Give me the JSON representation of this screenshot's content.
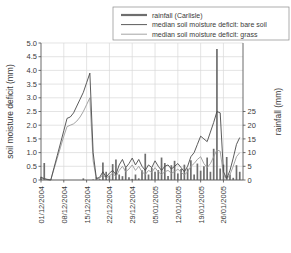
{
  "chart_data": {
    "type": "line",
    "title": "",
    "xlabel": "",
    "ylabel": "soil moisture deficit (mm)",
    "y2label": "rainfall (mm)",
    "ylim": [
      0,
      5.0
    ],
    "y2lim": [
      0,
      50
    ],
    "yticks": [
      "0",
      "0.5",
      "1.0",
      "1.5",
      "2.0",
      "2.5",
      "3.0",
      "3.5",
      "4.0",
      "4.5",
      "5.0"
    ],
    "ytick_values": [
      0,
      0.5,
      1.0,
      1.5,
      2.0,
      2.5,
      3.0,
      3.5,
      4.0,
      4.5,
      5.0
    ],
    "y2ticks": [
      "0",
      "5",
      "10",
      "15",
      "20",
      "25"
    ],
    "y2tick_values": [
      0,
      5,
      10,
      15,
      20,
      25
    ],
    "xticks": [
      "01/12/2004",
      "08/12/2004",
      "15/12/2004",
      "22/12/2004",
      "29/12/2004",
      "05/01/2005",
      "12/01/2005",
      "19/01/2005",
      "26/01/2005"
    ],
    "xtick_days": [
      0,
      7,
      14,
      21,
      28,
      35,
      42,
      49,
      56
    ],
    "xlim_days": [
      0,
      62
    ],
    "grid": true,
    "legend_position": "top-right",
    "legend": [
      {
        "label": "rainfall (Carlisle)",
        "color": "#6e6e6e",
        "style": "bar",
        "width": 2.2
      },
      {
        "label": "median soil moisture deficit: bare soil",
        "color": "#4a4a4a",
        "style": "line",
        "width": 0.9
      },
      {
        "label": "median soil moisture deficit: grass",
        "color": "#9a9a9a",
        "style": "line",
        "width": 0.9
      }
    ],
    "series": [
      {
        "name": "rainfall (Carlisle)",
        "axis": "right",
        "type": "bar",
        "unit": "mm",
        "x": [
          0,
          1,
          2,
          3,
          4,
          5,
          6,
          7,
          8,
          9,
          10,
          11,
          12,
          13,
          14,
          15,
          16,
          17,
          18,
          19,
          20,
          21,
          22,
          23,
          24,
          25,
          26,
          27,
          28,
          29,
          30,
          31,
          32,
          33,
          34,
          35,
          36,
          37,
          38,
          39,
          40,
          41,
          42,
          43,
          44,
          45,
          46,
          47,
          48,
          49,
          50,
          51,
          52,
          53,
          54,
          55,
          56,
          57,
          58,
          59,
          60,
          61
        ],
        "values": [
          1.2,
          6.2,
          0.4,
          0.2,
          0,
          0,
          0,
          0,
          0,
          0,
          0,
          0,
          0,
          0.6,
          0,
          0,
          0.2,
          1.0,
          0.3,
          6.4,
          3.0,
          1.6,
          5.8,
          7.5,
          2.0,
          1.4,
          4.5,
          1.0,
          0.4,
          2.0,
          0.6,
          3.6,
          9.6,
          2.0,
          4.4,
          3.0,
          3.6,
          8.2,
          6.2,
          1.5,
          5.4,
          7.0,
          2.4,
          4.0,
          5.6,
          4.2,
          7.2,
          2.0,
          6.0,
          3.4,
          5.0,
          8.2,
          3.0,
          11.4,
          47.8,
          4.2,
          5.6,
          8.4,
          2.0,
          0.8,
          5.4,
          3.0
        ],
        "max_value": 47.8,
        "max_value_date": "06/01/2005"
      },
      {
        "name": "median soil moisture deficit: bare soil",
        "axis": "left",
        "type": "line",
        "unit": "mm",
        "x": [
          0,
          1,
          2,
          3,
          4,
          5,
          6,
          7,
          8,
          9,
          10,
          11,
          12,
          13,
          14,
          15,
          16,
          17,
          18,
          19,
          20,
          21,
          22,
          23,
          24,
          25,
          26,
          27,
          28,
          29,
          30,
          31,
          32,
          33,
          34,
          35,
          36,
          37,
          38,
          39,
          40,
          41,
          42,
          43,
          44,
          45,
          46,
          47,
          48,
          49,
          50,
          51,
          52,
          53,
          54,
          55,
          56,
          57,
          58,
          59,
          60,
          61
        ],
        "values": [
          0.1,
          0.05,
          0.02,
          0.0,
          0.45,
          0.9,
          1.35,
          1.8,
          2.25,
          2.3,
          2.45,
          2.7,
          2.95,
          3.2,
          3.55,
          3.9,
          1.0,
          0.05,
          0.1,
          0.3,
          0.1,
          0.25,
          0.35,
          0.2,
          0.55,
          0.75,
          0.45,
          0.6,
          0.8,
          0.55,
          0.75,
          0.5,
          0.35,
          0.55,
          0.45,
          0.7,
          0.5,
          0.35,
          0.5,
          0.55,
          0.4,
          0.5,
          0.6,
          0.45,
          0.3,
          0.5,
          0.85,
          1.0,
          1.3,
          1.6,
          1.5,
          1.4,
          1.75,
          2.1,
          2.5,
          2.45,
          0.3,
          0.05,
          0.35,
          0.8,
          1.3,
          1.55
        ],
        "peak_value": 3.9,
        "peak_date": "14/12/2004"
      },
      {
        "name": "median soil moisture deficit: grass",
        "axis": "left",
        "type": "line",
        "unit": "mm",
        "x": [
          0,
          1,
          2,
          3,
          4,
          5,
          6,
          7,
          8,
          9,
          10,
          11,
          12,
          13,
          14,
          15,
          16,
          17,
          18,
          19,
          20,
          21,
          22,
          23,
          24,
          25,
          26,
          27,
          28,
          29,
          30,
          31,
          32,
          33,
          34,
          35,
          36,
          37,
          38,
          39,
          40,
          41,
          42,
          43,
          44,
          45,
          46,
          47,
          48,
          49,
          50,
          51,
          52,
          53,
          54,
          55,
          56,
          57,
          58,
          59,
          60,
          61
        ],
        "values": [
          0.08,
          0.04,
          0.01,
          0.0,
          0.4,
          0.8,
          1.2,
          1.6,
          1.95,
          2.0,
          2.05,
          2.15,
          2.3,
          2.5,
          2.75,
          3.0,
          0.7,
          0.03,
          0.06,
          0.2,
          0.07,
          0.15,
          0.25,
          0.12,
          0.35,
          0.5,
          0.3,
          0.4,
          0.55,
          0.35,
          0.5,
          0.3,
          0.2,
          0.35,
          0.28,
          0.45,
          0.3,
          0.2,
          0.3,
          0.35,
          0.25,
          0.3,
          0.4,
          0.28,
          0.18,
          0.3,
          0.5,
          0.6,
          0.75,
          0.85,
          0.6,
          0.45,
          0.6,
          0.85,
          1.1,
          1.05,
          0.2,
          0.02,
          0.2,
          0.5,
          0.85,
          1.0
        ],
        "peak_value": 3.0,
        "peak_date": "14/12/2004"
      }
    ]
  },
  "colors": {
    "grid": "#d9d9d9",
    "axis": "#5a5a5a",
    "text": "#3a3a3a",
    "rainfall": "#6e6e6e",
    "bare_soil": "#4a4a4a",
    "grass": "#9a9a9a",
    "background": "#ffffff"
  }
}
